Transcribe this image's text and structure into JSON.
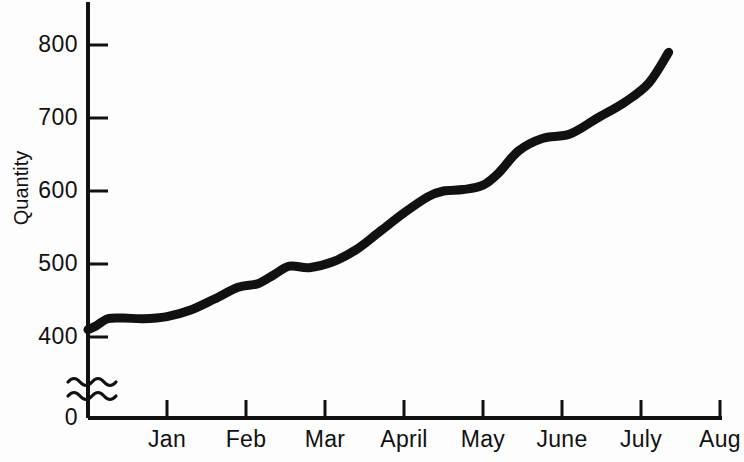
{
  "chart_data": {
    "type": "line",
    "title": "",
    "xlabel": "",
    "ylabel": "Quantity",
    "grid": false,
    "legend": false,
    "axis_break": {
      "present": true,
      "between": [
        0,
        400
      ],
      "style": "wavy-double"
    },
    "ylim": [
      400,
      830
    ],
    "yticks": [
      400,
      500,
      600,
      700,
      800
    ],
    "ytick_labels": [
      "400",
      "500",
      "600",
      "700",
      "800"
    ],
    "y_zero_label": "0",
    "categories": [
      "Jan",
      "Feb",
      "Mar",
      "April",
      "May",
      "June",
      "July",
      "Aug"
    ],
    "xtick_labels": [
      "Jan",
      "Feb",
      "Mar",
      "April",
      "May",
      "June",
      "July",
      "Aug"
    ],
    "series": [
      {
        "name": "Quantity",
        "color": "#111111",
        "x": [
          0.0,
          0.1,
          0.25,
          0.45,
          0.7,
          1.0,
          1.3,
          1.6,
          1.9,
          2.15,
          2.35,
          2.55,
          2.8,
          3.1,
          3.4,
          3.7,
          4.0,
          4.3,
          4.5,
          4.75,
          5.0,
          5.2,
          5.45,
          5.75,
          6.1,
          6.45,
          6.8,
          7.1,
          7.35
        ],
        "values": [
          410,
          415,
          425,
          426,
          425,
          428,
          437,
          452,
          468,
          473,
          485,
          497,
          495,
          503,
          520,
          545,
          570,
          592,
          600,
          602,
          608,
          625,
          655,
          672,
          678,
          700,
          722,
          748,
          790
        ]
      }
    ],
    "annotations": []
  },
  "axis": {
    "y_title": "Quantity",
    "zero_label": "0"
  }
}
